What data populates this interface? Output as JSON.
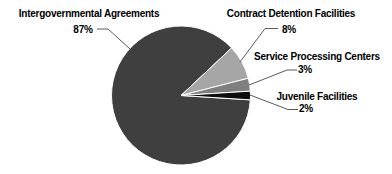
{
  "chart_data": {
    "type": "pie",
    "title": "",
    "categories": [
      "Intergovernmental Agreements",
      "Contract Detention Facilities",
      "Service Processing Centers",
      "Juvenile Facilities"
    ],
    "values": [
      87,
      8,
      3,
      2
    ],
    "unit": "%",
    "slices": [
      {
        "label": "Intergovernmental Agreements",
        "value": 87,
        "value_label": "87%",
        "color": "#3f3f3f"
      },
      {
        "label": "Contract Detention Facilities",
        "value": 8,
        "value_label": "8%",
        "color": "#a6a6a6"
      },
      {
        "label": "Service Processing Centers",
        "value": 3,
        "value_label": "3%",
        "color": "#7f7f7f"
      },
      {
        "label": "Juvenile Facilities",
        "value": 2,
        "value_label": "2%",
        "color": "#0d0d0d"
      }
    ],
    "start_angle_deg": 93.6,
    "direction": "clockwise",
    "legend_position": "callout-labels",
    "leader_line_color": "#595959",
    "text_color": "#000000",
    "slice_border_color": "#ffffff",
    "background_color": "#ffffff"
  }
}
